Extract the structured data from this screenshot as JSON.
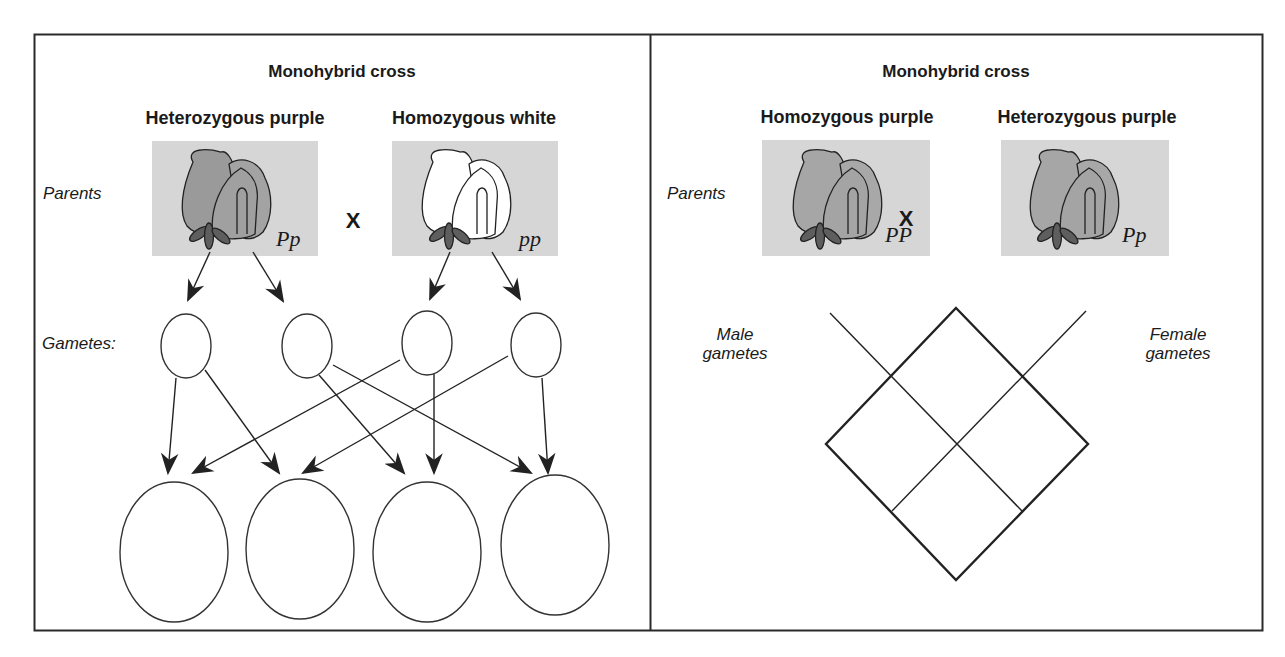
{
  "left_panel": {
    "title": "Monohybrid cross",
    "parent1_label": "Heterozygous purple",
    "parent2_label": "Homozygous white",
    "parents_label": "Parents",
    "parent1_genotype": "Pp",
    "parent2_genotype": "pp",
    "cross_symbol": "X",
    "gametes_label": "Gametes:",
    "parent1_flower_color": "purple",
    "parent2_flower_color": "white",
    "gamete_count": 4,
    "offspring_count": 4
  },
  "right_panel": {
    "title": "Monohybrid cross",
    "parent1_label": "Homozygous purple",
    "parent2_label": "Heterozygous purple",
    "parents_label": "Parents",
    "parent1_genotype": "PP",
    "parent2_genotype": "Pp",
    "cross_symbol": "X",
    "male_gametes_line1": "Male",
    "male_gametes_line2": "gametes",
    "female_gametes_line1": "Female",
    "female_gametes_line2": "gametes",
    "punnett_grid": "2x2 (rotated 45°)"
  },
  "colors": {
    "border": "#2a2a2a",
    "flower_bg": "#d6d6d6",
    "petal_purple": "#9a9a9a",
    "sepal": "#5e5e5e",
    "petal_white": "#ffffff"
  }
}
